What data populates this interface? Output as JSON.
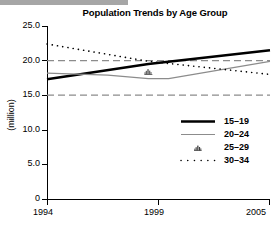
{
  "decor": {
    "top_bar_color": "#a6a6a6"
  },
  "chart_data": {
    "type": "line",
    "title": "Population Trends by Age Group",
    "xlabel": "",
    "ylabel": "(million)",
    "xlim": [
      1994,
      2005
    ],
    "ylim": [
      0,
      25
    ],
    "grid": "dashed horizontal reference lines at 15.0 and 20.0",
    "gridlines": [
      20.0,
      15.0
    ],
    "legend_position": "inside-right-middle",
    "x_ticks": [
      1994,
      1999,
      2005
    ],
    "x_tick_labels": [
      "1994",
      "1999",
      "2005"
    ],
    "y_ticks": [
      0,
      5.0,
      10.0,
      15.0,
      20.0,
      25.0
    ],
    "y_tick_labels": [
      "0",
      "5.0",
      "10.0",
      "15.0",
      "20.0",
      "25.0"
    ],
    "series": [
      {
        "name": "15–19",
        "style": "solid-thick-black",
        "color": "#000000",
        "x": [
          1994,
          1999,
          2005
        ],
        "values": [
          17.3,
          19.5,
          21.5
        ]
      },
      {
        "name": "20–24",
        "style": "solid-thin-gray",
        "color": "#808080",
        "x": [
          1994,
          1997,
          1999,
          2000,
          2005
        ],
        "values": [
          18.2,
          17.9,
          17.4,
          17.4,
          19.9
        ]
      },
      {
        "name": "25–29",
        "style": "marker-only",
        "color": "#4d4d4d",
        "x": [
          1999
        ],
        "values": [
          18.0
        ]
      },
      {
        "name": "30–34",
        "style": "dotted",
        "color": "#000000",
        "x": [
          1994,
          1999,
          2005
        ],
        "values": [
          22.4,
          19.9,
          18.0
        ]
      }
    ]
  },
  "legend": {
    "items": [
      {
        "label": "15–19",
        "key": "thick-black-line"
      },
      {
        "label": "20–24",
        "key": "thin-gray-line"
      },
      {
        "label": "25–29",
        "key": "cluster-marker"
      },
      {
        "label": "30–34",
        "key": "dotted-line"
      }
    ]
  }
}
